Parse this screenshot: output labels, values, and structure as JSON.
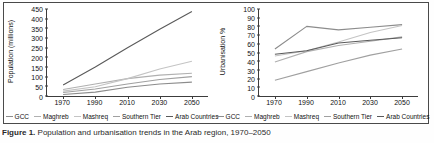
{
  "figure": {
    "caption_prefix": "Figure 1.",
    "caption_text": "Population and urbanisation trends in the Arab region, 1970–2050"
  },
  "series_names": [
    "GCC",
    "Maghreb",
    "Mashreq",
    "Southern Tier",
    "Arab Countries"
  ],
  "series_colors": [
    "#8c8c8c",
    "#b0b0b0",
    "#c4c4c4",
    "#a0a0a0",
    "#5a5a5a"
  ],
  "chart_data": [
    {
      "type": "line",
      "title": "",
      "xlabel": "",
      "ylabel": "Population (millions)",
      "x": [
        1970,
        1990,
        2010,
        2030,
        2050
      ],
      "xticklabels": [
        "1970",
        "1990",
        "2010",
        "2030",
        "2050"
      ],
      "xlim": [
        1960,
        2060
      ],
      "ylim": [
        0,
        450
      ],
      "yticks": [
        0,
        50,
        100,
        150,
        200,
        250,
        300,
        350,
        400,
        450
      ],
      "yticklabels": [
        "0",
        "50",
        "100",
        "150",
        "200",
        "250",
        "300",
        "350",
        "400",
        "450"
      ],
      "grid": false,
      "legend": "bottom",
      "series": [
        {
          "name": "GCC",
          "values": [
            8,
            20,
            45,
            62,
            72
          ]
        },
        {
          "name": "Maghreb",
          "values": [
            34,
            62,
            90,
            108,
            118
          ]
        },
        {
          "name": "Mashreq",
          "values": [
            25,
            48,
            90,
            140,
            180
          ]
        },
        {
          "name": "Southern Tier",
          "values": [
            18,
            36,
            62,
            85,
            100
          ]
        },
        {
          "name": "Arab Countries",
          "values": [
            57,
            150,
            250,
            345,
            437
          ]
        }
      ]
    },
    {
      "type": "line",
      "title": "",
      "xlabel": "",
      "ylabel": "Urbanisation %",
      "x": [
        1970,
        1990,
        2010,
        2030,
        2050
      ],
      "xticklabels": [
        "1970",
        "1990",
        "2010",
        "2030",
        "2050"
      ],
      "xlim": [
        1960,
        2060
      ],
      "ylim": [
        0,
        100
      ],
      "yticks": [
        0,
        10,
        20,
        30,
        40,
        50,
        60,
        70,
        80,
        90,
        100
      ],
      "yticklabels": [
        "0",
        "10",
        "20",
        "30",
        "40",
        "50",
        "60",
        "70",
        "80",
        "90",
        "100"
      ],
      "grid": false,
      "legend": "bottom",
      "series": [
        {
          "name": "GCC",
          "values": [
            54,
            80,
            76,
            79,
            82
          ]
        },
        {
          "name": "Maghreb",
          "values": [
            39,
            51,
            58,
            63,
            68
          ]
        },
        {
          "name": "Mashreq",
          "values": [
            46,
            52,
            62,
            73,
            81
          ]
        },
        {
          "name": "Southern Tier",
          "values": [
            18,
            28,
            38,
            47,
            54
          ]
        },
        {
          "name": "Arab Countries",
          "values": [
            48,
            52,
            61,
            64,
            67
          ]
        }
      ]
    }
  ]
}
